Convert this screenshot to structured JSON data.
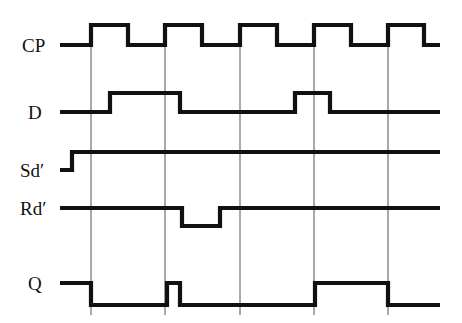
{
  "figure": {
    "type": "digital-timing-diagram",
    "background_color": "#ffffff",
    "stroke_color": "#111111",
    "gridline_color": "#555555",
    "width": 462,
    "height": 323
  },
  "axis": {
    "time_start_x": 60,
    "time_end_x": 440,
    "clock_edges_x": [
      91,
      165,
      240,
      314,
      388
    ],
    "gridline_top_y": 45,
    "gridline_bottom_y": 315
  },
  "signals": [
    {
      "name": "CP",
      "label": "CP",
      "row_index": 0,
      "low_y": 45,
      "high_y": 25,
      "initial_level": "low",
      "description": "clock pulse, 5 positive pulses",
      "transitions": [
        {
          "x": 91,
          "to": "high"
        },
        {
          "x": 128,
          "to": "low"
        },
        {
          "x": 165,
          "to": "high"
        },
        {
          "x": 202,
          "to": "low"
        },
        {
          "x": 240,
          "to": "high"
        },
        {
          "x": 277,
          "to": "low"
        },
        {
          "x": 314,
          "to": "high"
        },
        {
          "x": 351,
          "to": "low"
        },
        {
          "x": 388,
          "to": "high"
        },
        {
          "x": 424,
          "to": "low"
        }
      ]
    },
    {
      "name": "D",
      "label": "D",
      "row_index": 1,
      "low_y": 112,
      "high_y": 93,
      "initial_level": "low",
      "description": "data input",
      "transitions": [
        {
          "x": 110,
          "to": "high"
        },
        {
          "x": 180,
          "to": "low"
        },
        {
          "x": 295,
          "to": "high"
        },
        {
          "x": 330,
          "to": "low"
        }
      ]
    },
    {
      "name": "Sd",
      "label": "Sd′",
      "row_index": 2,
      "low_y": 170,
      "high_y": 152,
      "initial_level": "low",
      "description": "asynchronous set, active low",
      "transitions": [
        {
          "x": 72,
          "to": "high"
        }
      ]
    },
    {
      "name": "Rd",
      "label": "Rd′",
      "row_index": 3,
      "low_y": 226,
      "high_y": 208,
      "initial_level": "high",
      "description": "asynchronous reset, active low",
      "transitions": [
        {
          "x": 182,
          "to": "low"
        },
        {
          "x": 220,
          "to": "high"
        }
      ]
    },
    {
      "name": "Q",
      "label": "Q",
      "row_index": 4,
      "low_y": 305,
      "high_y": 283,
      "initial_level": "high",
      "description": "flip-flop output",
      "transitions": [
        {
          "x": 91,
          "to": "low"
        },
        {
          "x": 167,
          "to": "high"
        },
        {
          "x": 180,
          "to": "low"
        },
        {
          "x": 315,
          "to": "high"
        },
        {
          "x": 388,
          "to": "low"
        }
      ]
    }
  ],
  "label_positions": [
    {
      "name": "CP",
      "x": 22,
      "y": 52
    },
    {
      "name": "D",
      "x": 28,
      "y": 119
    },
    {
      "name": "Sd",
      "x": 20,
      "y": 177
    },
    {
      "name": "Rd",
      "x": 20,
      "y": 215
    },
    {
      "name": "Q",
      "x": 28,
      "y": 290
    }
  ]
}
